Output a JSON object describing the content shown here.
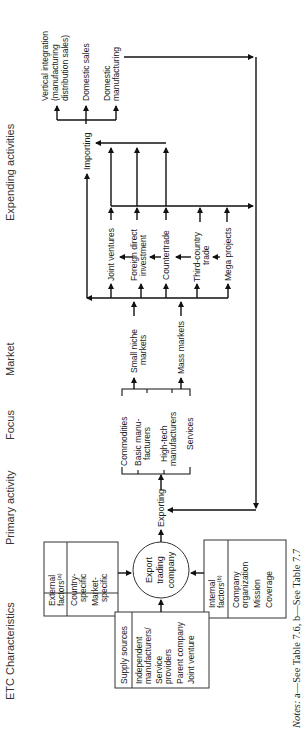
{
  "headers": {
    "expending": "Expending activities",
    "market": "Market",
    "focus": "Focus",
    "primary": "Primary activity",
    "etc": "ETC Characteristics"
  },
  "center": {
    "line1": "Export",
    "line2": "trading",
    "line3": "company"
  },
  "external_factors": {
    "title1": "External",
    "title2": "factors",
    "sup": "(a)",
    "items": [
      "Country-",
      "specific",
      "Market-",
      "specific"
    ]
  },
  "internal_factors": {
    "title1": "Internal",
    "title2": "factors",
    "sup": "(b)",
    "items": [
      "Company",
      "organization",
      "Mission",
      "Coverage"
    ]
  },
  "supply_sources": {
    "title": "Supply sources",
    "items": [
      "Independent",
      "manufacturers/",
      "Service",
      "providers",
      "Parent company",
      "Joint venture"
    ]
  },
  "primary_activity": "Exporting",
  "focus_items": [
    [
      "Commodities"
    ],
    [
      "Basic manu-",
      "facturers"
    ],
    [
      "High-tech",
      "manufacturers"
    ],
    [
      "Services"
    ]
  ],
  "markets": [
    [
      "Small niche",
      "markets"
    ],
    [
      "Mass markets"
    ]
  ],
  "expending_modes": [
    [
      "Joint ventures"
    ],
    [
      "Foreign direct",
      "investment"
    ],
    [
      "Countertrade"
    ],
    [
      "Third-country",
      "trade"
    ],
    [
      "Mega projects"
    ]
  ],
  "importing": "Importing",
  "import_outcomes": [
    [
      "Vertical integration",
      "(manufacturing",
      "distribution sales)"
    ],
    [
      "Domestic sales"
    ],
    [
      "Domestic",
      "manufacturing"
    ]
  ],
  "notes": "Notes: a—See Table 7.6, b—See Table 7.7"
}
